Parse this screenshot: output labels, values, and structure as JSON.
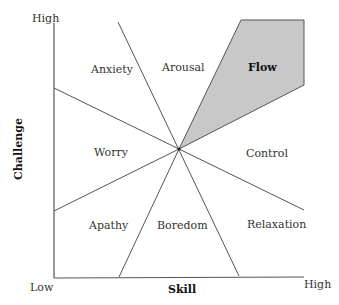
{
  "diagram": {
    "y_axis": {
      "label": "Challenge",
      "high": "High"
    },
    "x_axis": {
      "label": "Skill",
      "low": "Low",
      "high": "High"
    },
    "regions": [
      {
        "name": "Anxiety"
      },
      {
        "name": "Arousal"
      },
      {
        "name": "Flow",
        "highlighted": true
      },
      {
        "name": "Worry"
      },
      {
        "name": "Control"
      },
      {
        "name": "Apathy"
      },
      {
        "name": "Boredom"
      },
      {
        "name": "Relaxation"
      }
    ],
    "colors": {
      "flow_fill": "#c8c8c8",
      "line": "#444444"
    }
  }
}
